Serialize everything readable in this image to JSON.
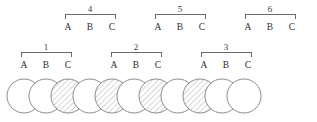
{
  "figure": {
    "title": "",
    "background_color": "#ffffff",
    "line_color": "#5a5a5a",
    "circle_stroke_color": "#6e6e6e",
    "hatch_color": "#8a8a8a",
    "site_letters": [
      "A",
      "B",
      "C"
    ],
    "bracket_rows": [
      {
        "row": "upper",
        "groups": [
          {
            "number": "4",
            "labels": [
              "A",
              "B",
              "C"
            ],
            "label_x": [
              68,
              90,
              112
            ],
            "bracket_left": 65,
            "bracket_right": 115,
            "bracket_y": 14,
            "tick_depth": 5,
            "number_x": 90,
            "number_y": 12,
            "label_y": 30
          },
          {
            "number": "5",
            "labels": [
              "A",
              "B",
              "C"
            ],
            "label_x": [
              158,
              180,
              202
            ],
            "bracket_left": 155,
            "bracket_right": 205,
            "bracket_y": 14,
            "tick_depth": 5,
            "number_x": 180,
            "number_y": 12,
            "label_y": 30
          },
          {
            "number": "6",
            "labels": [
              "A",
              "B",
              "C"
            ],
            "label_x": [
              248,
              270,
              292
            ],
            "bracket_left": 245,
            "bracket_right": 295,
            "bracket_y": 14,
            "tick_depth": 5,
            "number_x": 270,
            "number_y": 12,
            "label_y": 30
          }
        ]
      },
      {
        "row": "lower",
        "groups": [
          {
            "number": "1",
            "labels": [
              "A",
              "B",
              "C"
            ],
            "label_x": [
              24,
              46,
              68
            ],
            "bracket_left": 21,
            "bracket_right": 71,
            "bracket_y": 52,
            "tick_depth": 5,
            "number_x": 46,
            "number_y": 50,
            "label_y": 68
          },
          {
            "number": "2",
            "labels": [
              "A",
              "B",
              "C"
            ],
            "label_x": [
              114,
              136,
              158
            ],
            "bracket_left": 111,
            "bracket_right": 161,
            "bracket_y": 52,
            "tick_depth": 5,
            "number_x": 136,
            "number_y": 50,
            "label_y": 68
          },
          {
            "number": "3",
            "labels": [
              "A",
              "B",
              "C"
            ],
            "label_x": [
              204,
              226,
              248
            ],
            "bracket_left": 201,
            "bracket_right": 251,
            "bracket_y": 52,
            "tick_depth": 5,
            "number_x": 226,
            "number_y": 50,
            "label_y": 68
          }
        ]
      }
    ],
    "chain": {
      "circle_radius": 17,
      "center_y": 96,
      "spacing": 22,
      "first_center_x": 24,
      "count": 11,
      "fills": [
        "white",
        "white",
        "hatched",
        "white",
        "hatched",
        "white",
        "hatched",
        "white",
        "hatched",
        "white",
        "white"
      ],
      "centers_x": [
        24,
        46,
        68,
        90,
        112,
        134,
        156,
        178,
        200,
        222,
        244
      ]
    }
  }
}
